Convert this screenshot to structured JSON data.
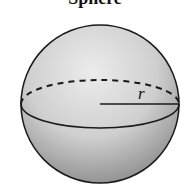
{
  "title": "Sphere",
  "labels": {
    "radius": "r"
  },
  "colors": {
    "outline": "#1a1a1a",
    "fill_light": "#e4e4e4",
    "fill_dark": "#8e8e8e"
  },
  "shape": {
    "type": "sphere",
    "center": [
      100,
      104
    ],
    "radius": 80
  }
}
